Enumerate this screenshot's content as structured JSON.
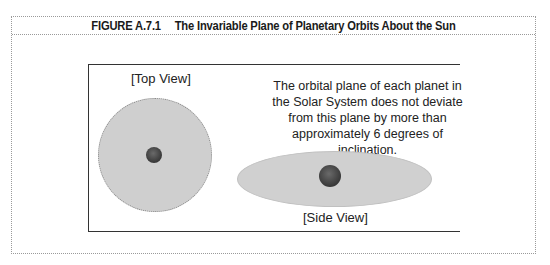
{
  "figure": {
    "number": "FIGURE A.7.1",
    "title": "The Invariable Plane of Planetary Orbits About the Sun"
  },
  "diagram": {
    "top_view_label": "[Top View]",
    "side_view_label": "[Side View]",
    "description": "The orbital plane of each planet in the Solar System does not deviate from this plane by more than approximately 6 degrees of inclination.",
    "colors": {
      "plane_fill": "#cfcfcf",
      "sun_fill": "#444444",
      "frame_line": "#333333",
      "dotted_border": "#9a9a9a"
    }
  }
}
